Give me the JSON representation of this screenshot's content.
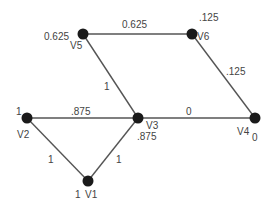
{
  "diagram": {
    "type": "weighted-graph",
    "nodes": [
      {
        "id": "V1",
        "label": "V1",
        "value": "1",
        "x": 88,
        "y": 181
      },
      {
        "id": "V2",
        "label": "V2",
        "value": "1",
        "x": 27,
        "y": 118
      },
      {
        "id": "V3",
        "label": "V3",
        "value": ".875",
        "x": 138,
        "y": 118
      },
      {
        "id": "V4",
        "label": "V4",
        "value": "0",
        "x": 255,
        "y": 118
      },
      {
        "id": "V5",
        "label": "V5",
        "value": "0.625",
        "x": 83,
        "y": 34
      },
      {
        "id": "V6",
        "label": "V6",
        "value": ".125",
        "x": 192,
        "y": 34
      }
    ],
    "edges": [
      {
        "from": "V5",
        "to": "V6",
        "weight": "0.625"
      },
      {
        "from": "V5",
        "to": "V3",
        "weight": "1"
      },
      {
        "from": "V6",
        "to": "V4",
        "weight": ".125"
      },
      {
        "from": "V2",
        "to": "V3",
        "weight": ".875"
      },
      {
        "from": "V3",
        "to": "V4",
        "weight": "0"
      },
      {
        "from": "V2",
        "to": "V1",
        "weight": "1"
      },
      {
        "from": "V3",
        "to": "V1",
        "weight": "1"
      }
    ]
  },
  "colors": {
    "node": "#1a1a1a",
    "edge": "#555555",
    "text": "#444444"
  }
}
